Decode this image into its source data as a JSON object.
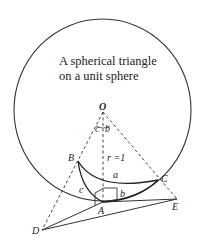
{
  "title": {
    "line1": "A spherical triangle",
    "line2": "on a unit sphere"
  },
  "points": {
    "O": "O",
    "A": "A",
    "B": "B",
    "C": "C",
    "D": "D",
    "E": "E"
  },
  "labels": {
    "radius": "r =1",
    "side_a": "a",
    "side_b": "b",
    "side_c": "c",
    "angle_c": "c",
    "angle_b": "b"
  }
}
